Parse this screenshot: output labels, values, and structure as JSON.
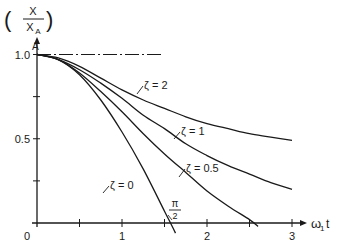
{
  "chart_data": {
    "type": "line",
    "title": "",
    "xlabel": "ω₁t",
    "ylabel": "(X / X_A)",
    "ylabel_num": "X",
    "ylabel_den": "X",
    "ylabel_den_sub": "A",
    "xlim": [
      0,
      3.2
    ],
    "ylim": [
      0,
      1.1
    ],
    "grid": false,
    "legend": "inline labels on curves",
    "x_ticks": [
      0,
      0.5,
      1,
      1.5,
      2,
      2.5,
      3
    ],
    "x_tick_labels": [
      "0",
      "",
      "1",
      "",
      "2",
      "",
      "3"
    ],
    "y_ticks": [
      0,
      0.25,
      0.5,
      0.75,
      1.0
    ],
    "y_tick_labels": [
      "",
      "",
      "0.5",
      "",
      "1.0"
    ],
    "annotations": [
      {
        "text": "A",
        "x": 0,
        "y": 1.0,
        "note": "starting point"
      },
      {
        "text": "π/2",
        "x": 1.571,
        "y": 0,
        "note": "ζ=0 crosses zero at π/2"
      },
      {
        "text": "dash-dot reference line at X/X_A = 1.0",
        "x": [
          0,
          1.55
        ],
        "y": 1.0
      }
    ],
    "series": [
      {
        "name": "ζ = 2",
        "label": "ζ = 2",
        "x": [
          0,
          0.25,
          0.5,
          0.75,
          1.0,
          1.25,
          1.5,
          1.75,
          2.0,
          2.25,
          2.5,
          2.75,
          3.0
        ],
        "y": [
          1.0,
          0.98,
          0.93,
          0.86,
          0.79,
          0.73,
          0.68,
          0.63,
          0.59,
          0.56,
          0.53,
          0.51,
          0.49
        ]
      },
      {
        "name": "ζ = 1",
        "label": "ζ = 1",
        "x": [
          0,
          0.25,
          0.5,
          0.75,
          1.0,
          1.25,
          1.5,
          1.75,
          2.0,
          2.25,
          2.5,
          2.75,
          3.0
        ],
        "y": [
          1.0,
          0.97,
          0.91,
          0.83,
          0.74,
          0.64,
          0.56,
          0.47,
          0.4,
          0.34,
          0.29,
          0.24,
          0.2
        ]
      },
      {
        "name": "ζ = 0.5",
        "label": "ζ = 0.5",
        "x": [
          0,
          0.25,
          0.5,
          0.75,
          1.0,
          1.25,
          1.5,
          1.75,
          2.0,
          2.25,
          2.5,
          2.6
        ],
        "y": [
          1.0,
          0.97,
          0.89,
          0.78,
          0.66,
          0.53,
          0.41,
          0.3,
          0.19,
          0.1,
          0.02,
          -0.02
        ]
      },
      {
        "name": "ζ = 0",
        "label": "ζ = 0",
        "x": [
          0,
          0.25,
          0.5,
          0.75,
          1.0,
          1.25,
          1.5,
          1.571,
          1.63
        ],
        "y": [
          1.0,
          0.97,
          0.88,
          0.73,
          0.54,
          0.32,
          0.07,
          0.0,
          -0.06
        ]
      }
    ]
  }
}
